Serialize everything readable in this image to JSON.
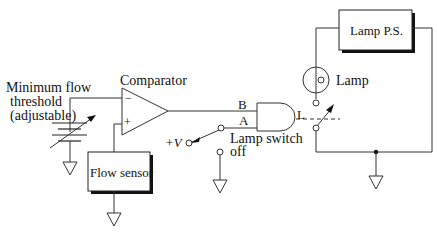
{
  "diagram": {
    "type": "circuit-schematic",
    "labels": {
      "threshold_line1": "Minimum flow",
      "threshold_line2": "threshold",
      "threshold_line3": "(adjustable)",
      "comparator": "Comparator",
      "comparator_minus": "−",
      "comparator_plus": "+",
      "flow_sensor": "Flow sensor",
      "input_b": "B",
      "input_a": "A",
      "output_l": "L",
      "plus_v": "+V",
      "lamp_switch_line1": "Lamp switch",
      "lamp_switch_line2": "off",
      "lamp_ps": "Lamp P.S.",
      "lamp": "Lamp"
    },
    "components": [
      {
        "id": "threshold-source",
        "kind": "variable-voltage-source"
      },
      {
        "id": "comparator",
        "kind": "op-amp-comparator"
      },
      {
        "id": "flow-sensor",
        "kind": "box"
      },
      {
        "id": "and-gate",
        "kind": "logic-and",
        "inputs": [
          "B",
          "A"
        ],
        "output": "L"
      },
      {
        "id": "lamp-switch",
        "kind": "spdt-switch",
        "positions": [
          "+V",
          "off"
        ]
      },
      {
        "id": "relay-switch",
        "kind": "relay-contact",
        "controlled_by": "L"
      },
      {
        "id": "lamp",
        "kind": "lamp"
      },
      {
        "id": "lamp-ps",
        "kind": "box"
      }
    ],
    "colors": {
      "line": "#333333",
      "background": "#ffffff",
      "shadow": "#111111"
    }
  }
}
